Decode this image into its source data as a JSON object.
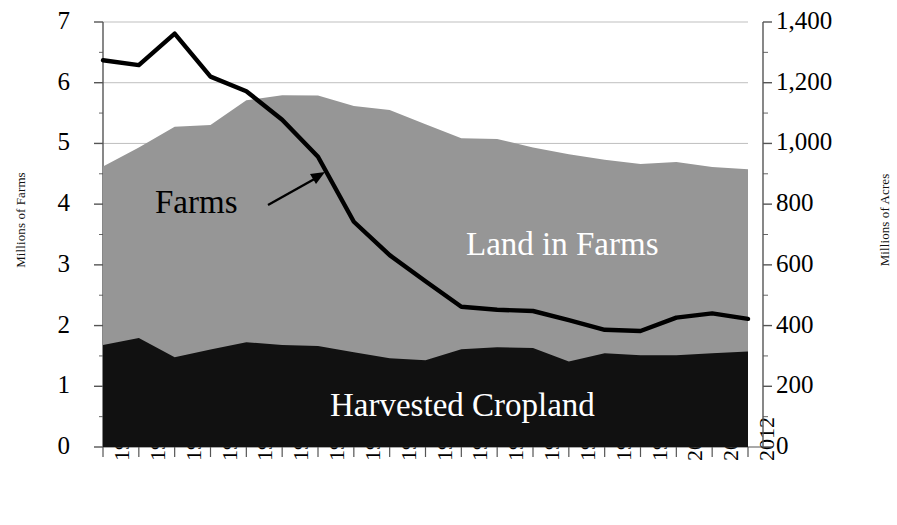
{
  "chart_data": {
    "type": "area",
    "title": "",
    "subtitle": "",
    "xlabel": "",
    "ylabel": "Millions of Farms",
    "y2label": "Millions of Acres",
    "ylim": [
      0,
      7
    ],
    "y2lim": [
      0,
      1400
    ],
    "grid": true,
    "legend_position": "in-plot annotations",
    "categories": [
      "1925",
      "1930",
      "1935",
      "1940",
      "1945",
      "1950",
      "1954",
      "1959",
      "1964",
      "1969",
      "1974",
      "1978",
      "1982",
      "1987",
      "1992",
      "1997",
      "2002",
      "2007",
      "2012"
    ],
    "y_ticks": [
      "0",
      "1",
      "2",
      "3",
      "4",
      "5",
      "6",
      "7"
    ],
    "y2_ticks": [
      "0",
      "200",
      "400",
      "600",
      "800",
      "1,000",
      "1,200",
      "1,400"
    ],
    "series": [
      {
        "name": "Land in Farms",
        "axis": "right",
        "units": "Millions of Acres",
        "stack": "total",
        "color": "#969696",
        "label_color": "#ffffff",
        "values": [
          924,
          987,
          1055,
          1061,
          1142,
          1159,
          1158,
          1123,
          1110,
          1063,
          1017,
          1015,
          987,
          964,
          946,
          932,
          939,
          922,
          915
        ]
      },
      {
        "name": "Harvested Cropland",
        "axis": "right",
        "units": "Millions of Acres",
        "stack": "bottom",
        "color": "#111111",
        "label_color": "#ffffff",
        "values": [
          336,
          359,
          296,
          321,
          345,
          336,
          333,
          312,
          292,
          286,
          322,
          329,
          326,
          282,
          309,
          302,
          302,
          309,
          315
        ]
      },
      {
        "name": "Farms",
        "axis": "left",
        "units": "Millions of Farms",
        "type": "line",
        "color": "#000000",
        "label_color": "#000000",
        "values": [
          6.37,
          6.29,
          6.81,
          6.1,
          5.86,
          5.39,
          4.78,
          3.71,
          3.16,
          2.73,
          2.31,
          2.26,
          2.24,
          2.09,
          1.93,
          1.91,
          2.13,
          2.2,
          2.11
        ]
      }
    ],
    "annotations": [
      {
        "name": "farms-callout",
        "text": "Farms",
        "kind": "label-with-arrow"
      },
      {
        "name": "land-in-farms-label",
        "text": "Land in Farms",
        "kind": "label"
      },
      {
        "name": "harvested-cropland-label",
        "text": "Harvested Cropland",
        "kind": "label"
      }
    ]
  },
  "axes": {
    "left": {
      "title": "Millions of Farms",
      "ticks": [
        "7",
        "6",
        "5",
        "4",
        "3",
        "2",
        "1",
        "0"
      ]
    },
    "right": {
      "title": "Millions of Acres",
      "ticks": [
        "1,400",
        "1,200",
        "1,000",
        "800",
        "600",
        "400",
        "200",
        "0"
      ]
    },
    "x": {
      "ticks": [
        "1925",
        "1930",
        "1935",
        "1940",
        "1945",
        "1950",
        "1954",
        "1959",
        "1964",
        "1969",
        "1974",
        "1978",
        "1982",
        "1987",
        "1992",
        "1997",
        "2002",
        "2007",
        "2012"
      ]
    }
  },
  "labels": {
    "farms": "Farms",
    "land_in_farms": "Land in Farms",
    "harvested_cropland": "Harvested Cropland"
  },
  "colors": {
    "land_in_farms": "#969696",
    "harvested_cropland": "#111111",
    "farms_line": "#000000",
    "gridline": "#bfbfbf",
    "axis": "#555555",
    "background": "#ffffff"
  }
}
